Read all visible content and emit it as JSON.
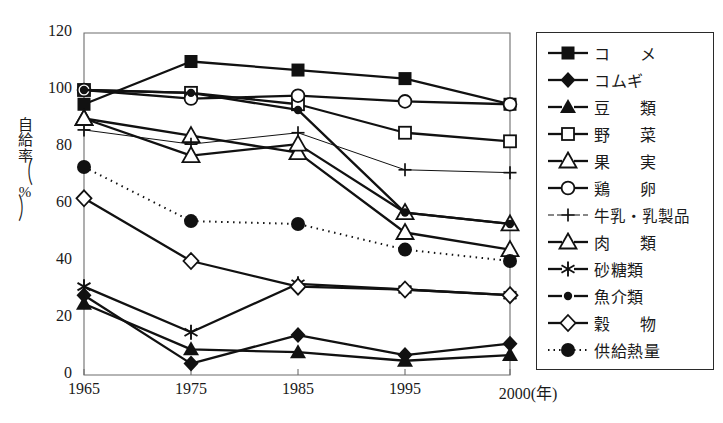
{
  "chart_data": {
    "type": "line",
    "title": "",
    "xlabel": "(年)",
    "ylabel": "自給率 (%)",
    "x": [
      1965,
      1975,
      1985,
      1995,
      2000
    ],
    "xtick_labels": [
      "1965",
      "1975",
      "1985",
      "1995",
      "2000"
    ],
    "ytick_labels": [
      "0",
      "20",
      "40",
      "60",
      "80",
      "100",
      "120"
    ],
    "ytick_values": [
      0,
      20,
      40,
      60,
      80,
      100,
      120
    ],
    "ylim": [
      0,
      120
    ],
    "grid": false,
    "legend_position": "right",
    "series": [
      {
        "name": "コ　メ",
        "label_style": "wide",
        "marker": "filled-square",
        "line": "solid",
        "values": [
          95,
          110,
          107,
          104,
          95
        ]
      },
      {
        "name": "コムギ",
        "label_style": "normal",
        "marker": "filled-diamond",
        "line": "solid",
        "values": [
          28,
          4,
          14,
          7,
          11
        ]
      },
      {
        "name": "豆　類",
        "label_style": "wide",
        "marker": "filled-triangle",
        "line": "solid",
        "values": [
          25,
          9,
          8,
          5,
          7
        ]
      },
      {
        "name": "野　菜",
        "label_style": "wide",
        "marker": "open-square",
        "line": "solid",
        "values": [
          100,
          99,
          95,
          85,
          82
        ]
      },
      {
        "name": "果　実",
        "label_style": "wide",
        "marker": "open-triangle",
        "line": "solid",
        "values": [
          90,
          84,
          78,
          50,
          44
        ]
      },
      {
        "name": "鶏　卵",
        "label_style": "wide",
        "marker": "open-circle",
        "line": "solid",
        "values": [
          100,
          97,
          98,
          96,
          95
        ]
      },
      {
        "name": "牛乳・乳製品",
        "label_style": "narrow",
        "marker": "plus",
        "line": "thin",
        "values": [
          86,
          81,
          85,
          72,
          71
        ]
      },
      {
        "name": "肉　類",
        "label_style": "wide",
        "marker": "open-triangle",
        "line": "solid",
        "values": [
          90,
          77,
          81,
          57,
          53
        ]
      },
      {
        "name": "砂糖類",
        "label_style": "normal",
        "marker": "asterisk",
        "line": "solid",
        "values": [
          31,
          15,
          32,
          30,
          28
        ]
      },
      {
        "name": "魚介類",
        "label_style": "normal",
        "marker": "small-filled-circle",
        "line": "solid",
        "values": [
          100,
          99,
          93,
          57,
          53
        ]
      },
      {
        "name": "穀　物",
        "label_style": "wide",
        "marker": "open-diamond",
        "line": "solid",
        "values": [
          62,
          40,
          31,
          30,
          28
        ]
      },
      {
        "name": "供給熱量",
        "label_style": "normal",
        "marker": "big-filled-circle",
        "line": "dotted",
        "values": [
          73,
          54,
          53,
          44,
          40
        ]
      }
    ]
  }
}
